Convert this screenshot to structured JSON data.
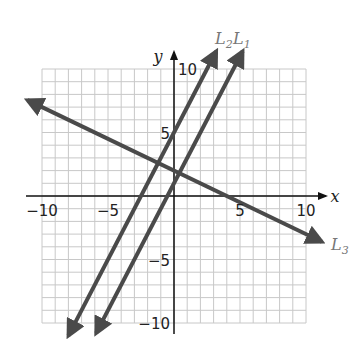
{
  "chart_data": {
    "type": "line",
    "title": "",
    "xlabel": "x",
    "ylabel": "y",
    "xlim": [
      -10,
      10
    ],
    "ylim": [
      -10,
      10
    ],
    "grid": true,
    "grid_step": 1,
    "x_ticks": [
      -10,
      -5,
      5,
      10
    ],
    "y_ticks": [
      -10,
      -5,
      5,
      10
    ],
    "x_tick_labels": [
      "−10",
      "−5",
      "5",
      "10"
    ],
    "y_tick_labels": [
      "−10",
      "−5",
      "5",
      "10"
    ],
    "series": [
      {
        "name": "L1",
        "label_main": "L",
        "label_sub": "1",
        "slope": 2,
        "intercept": 1,
        "equation": "y = 2x + 1",
        "x": [
          -5.9,
          5.2
        ],
        "y": [
          -10.8,
          11.4
        ]
      },
      {
        "name": "L2",
        "label_main": "L",
        "label_sub": "2",
        "slope": 2,
        "intercept": 5,
        "equation": "y = 2x + 5",
        "x": [
          -8.0,
          3.2
        ],
        "y": [
          -11.0,
          11.4
        ]
      },
      {
        "name": "L3",
        "label_main": "L",
        "label_sub": "3",
        "slope": -0.5,
        "intercept": 2,
        "equation": "y = -0.5x + 2",
        "x": [
          -11.1,
          11.2
        ],
        "y": [
          7.55,
          -3.6
        ]
      }
    ],
    "annotations": [
      "L2",
      "L1",
      "L3"
    ]
  },
  "colors": {
    "grid": "#c8c8c8",
    "axes": "#111111",
    "lines": "#4a4a4a",
    "line_labels": "#777777",
    "background": "#ffffff"
  }
}
